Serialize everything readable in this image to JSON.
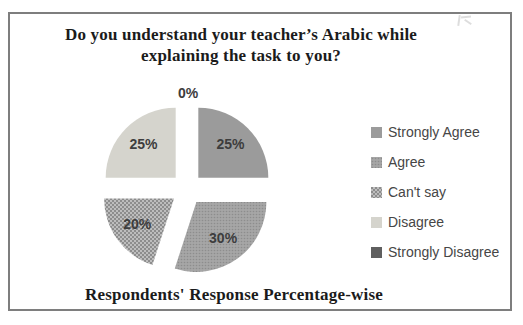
{
  "title_lines": [
    "Do you understand your teacher’s Arabic while",
    "explaining the task to you?"
  ],
  "caption": "Respondents' Response Percentage-wise",
  "colors": {
    "strongly_agree": "#9b9b9b",
    "agree": "#a1a1a1",
    "cant_say": "#a8a8a8",
    "disagree": "#d5d4cd",
    "strongly_disagree": "#5f5f5f",
    "frame_border": "#7e7e7e",
    "label_text": "#3d3d3d"
  },
  "chart_data": {
    "type": "pie",
    "title": "Do you understand your teacher’s Arabic while explaining the task to you?",
    "caption": "Respondents' Response Percentage-wise",
    "unit": "percent",
    "style": "exploded-pie, grayscale",
    "legend_position": "right",
    "start_angle_deg": 0,
    "direction": "clockwise",
    "slices": [
      {
        "label": "Strongly Agree",
        "value": 25,
        "data_label": "25%",
        "fill": "#9b9b9b"
      },
      {
        "label": "Agree",
        "value": 30,
        "data_label": "30%",
        "fill": "pattern:dots-fine",
        "base_color": "#a1a1a1"
      },
      {
        "label": "Can't say",
        "value": 20,
        "data_label": "20%",
        "fill": "pattern:dots-coarse",
        "base_color": "#a8a8a8"
      },
      {
        "label": "Disagree",
        "value": 25,
        "data_label": "25%",
        "fill": "#d5d4cd"
      },
      {
        "label": "Strongly Disagree",
        "value": 0,
        "data_label": "0%",
        "fill": "#5f5f5f"
      }
    ]
  }
}
